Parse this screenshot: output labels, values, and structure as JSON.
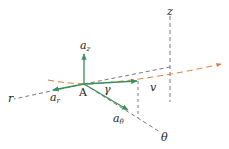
{
  "diagram": {
    "colors": {
      "vector": "#3a8f5a",
      "path": "#e07a3a",
      "axis": "#555555",
      "text": "#222222"
    },
    "labels": {
      "point": "A",
      "r_axis": "r",
      "theta_axis": "θ",
      "z_axis": "z",
      "a_r_base": "a",
      "a_r_sub": "r",
      "a_theta_base": "a",
      "a_theta_sub": "θ",
      "a_z_base": "a",
      "a_z_sub": "z",
      "velocity": "v",
      "angle": "γ"
    },
    "nodes": [
      {
        "id": "A",
        "x": 84,
        "y": 84
      },
      {
        "id": "v_tip",
        "x": 137,
        "y": 81
      },
      {
        "id": "a_z_tip",
        "x": 84,
        "y": 53
      },
      {
        "id": "a_r_tip",
        "x": 52,
        "y": 90
      },
      {
        "id": "a_theta_tip",
        "x": 128,
        "y": 111
      }
    ],
    "edges": [
      {
        "from": "A",
        "to": "a_z_tip",
        "kind": "vector"
      },
      {
        "from": "A",
        "to": "a_r_tip",
        "kind": "vector"
      },
      {
        "from": "A",
        "to": "a_theta_tip",
        "kind": "vector"
      },
      {
        "from": "A",
        "to": "v_tip",
        "kind": "vector"
      }
    ]
  }
}
